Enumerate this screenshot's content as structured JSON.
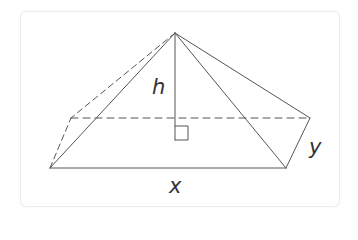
{
  "diagram": {
    "type": "geometry-figure",
    "colors": {
      "card_border": "#ececec",
      "stroke": "#555555",
      "label": "#333333"
    },
    "labels": {
      "height": "h",
      "base_length": "x",
      "base_width": "y"
    },
    "vertices": {
      "apex": [
        175,
        33
      ],
      "front_left": [
        50,
        168
      ],
      "front_right": [
        286,
        168
      ],
      "back_left": [
        71,
        118
      ],
      "back_right": [
        310,
        118
      ],
      "height_foot": [
        175,
        118
      ]
    },
    "edges": {
      "solid": [
        [
          "front_left",
          "front_right"
        ],
        [
          "front_right",
          "back_right"
        ],
        [
          "apex",
          "front_left"
        ],
        [
          "apex",
          "front_right"
        ],
        [
          "apex",
          "back_right"
        ],
        [
          "apex",
          "height_foot"
        ]
      ],
      "dashed": [
        [
          "front_left",
          "back_left"
        ],
        [
          "back_left",
          "back_right"
        ],
        [
          "apex",
          "back_left"
        ]
      ]
    },
    "right_angle_marker": {
      "corner": [
        175,
        125
      ],
      "size": 13
    }
  }
}
